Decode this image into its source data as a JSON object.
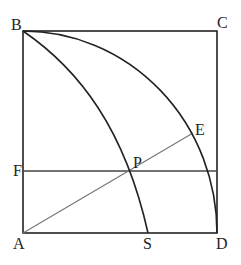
{
  "diagram": {
    "type": "geometry",
    "colors": {
      "stroke": "#222222",
      "secondary_stroke": "#777777",
      "background": "#ffffff"
    },
    "points": {
      "A": {
        "label": "A",
        "x": 23,
        "y": 233
      },
      "B": {
        "label": "B",
        "x": 23,
        "y": 31
      },
      "C": {
        "label": "C",
        "x": 217,
        "y": 31
      },
      "D": {
        "label": "D",
        "x": 217,
        "y": 233
      },
      "E": {
        "label": "E",
        "x": 193,
        "y": 133
      },
      "F": {
        "label": "F",
        "x": 23,
        "y": 171
      },
      "P": {
        "label": "P",
        "x": 132,
        "y": 171
      },
      "S": {
        "label": "S",
        "x": 148,
        "y": 233
      }
    },
    "segments": [
      "AB",
      "BC",
      "CD",
      "DA",
      "FP-line (F to right side)",
      "AE"
    ],
    "arcs": [
      "B to D (quarter circle centered at A)",
      "B to S (curve through P)"
    ]
  }
}
